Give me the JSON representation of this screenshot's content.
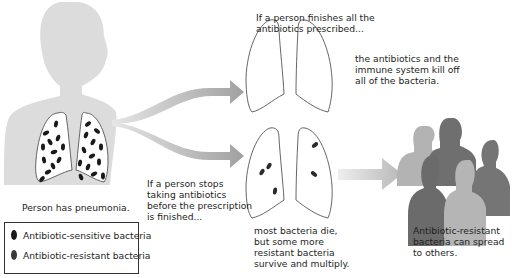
{
  "diagram": {
    "colors": {
      "body_silhouette": "#dedede",
      "arrow": "#a8a8a8",
      "lung_outline": "#555555",
      "sensitive_bacteria": "#1a1a1a",
      "resistant_bacteria": "#333333",
      "people_dark": "#6e6e6e",
      "people_light": "#b2b2b2"
    },
    "start": {
      "caption": "Person has pneumonia.",
      "lungs_state": "infected with many bacteria"
    },
    "branch_top": {
      "condition_lines": [
        "If a person finishes all the",
        "antibiotics prescribed..."
      ],
      "outcome_lines": [
        "the antibiotics and the",
        "immune system kill off",
        "all of the bacteria."
      ],
      "lungs_state": "clear"
    },
    "branch_bottom": {
      "condition_lines": [
        "If a person stops",
        "taking antibiotics",
        "before the prescription",
        "is finished..."
      ],
      "outcome_lines": [
        "most bacteria die,",
        "but some more",
        "resistant bacteria",
        "survive and multiply."
      ],
      "lungs_state": "few resistant bacteria remain"
    },
    "end": {
      "caption_lines": [
        "Antibiotic-resistant",
        "bacteria can spread",
        "to others."
      ]
    },
    "legend": {
      "items": [
        {
          "label": "Antibiotic-sensitive bacteria",
          "color": "#1a1a1a"
        },
        {
          "label": "Antibiotic-resistant bacteria",
          "color": "#3a3a3a"
        }
      ]
    }
  }
}
